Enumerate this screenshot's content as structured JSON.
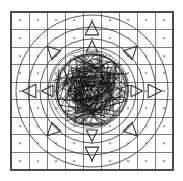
{
  "figure": {
    "background_color": "#ffffff",
    "width": 183,
    "height": 181
  },
  "grid": {
    "name": "cell-grid",
    "columns": 9,
    "rows": 9,
    "left": 11,
    "top": 12,
    "right": 173,
    "bottom": 170,
    "cell_mark": "×",
    "line_color": "#6f6f6f",
    "frame_color": "#4a4a4a",
    "mark_color": "#4f4f4f",
    "marks": [
      [
        "×",
        "×",
        "×",
        "×",
        "×",
        "×",
        "×",
        "×",
        "×"
      ],
      [
        "×",
        "×",
        "×",
        "×",
        "×",
        "×",
        "×",
        "×",
        "×"
      ],
      [
        "×",
        "×",
        "×",
        "×",
        "×",
        "×",
        "×",
        "×",
        "×"
      ],
      [
        "×",
        "×",
        "×",
        "×",
        "×",
        "×",
        "×",
        "×",
        "×"
      ],
      [
        "×",
        "×",
        "×",
        "×",
        "×",
        "×",
        "×",
        "×",
        "×"
      ],
      [
        "×",
        "×",
        "×",
        "×",
        "×",
        "×",
        "×",
        "×",
        "×"
      ],
      [
        "×",
        "×",
        "×",
        "×",
        "×",
        "×",
        "×",
        "×",
        "×"
      ],
      [
        "×",
        "×",
        "×",
        "×",
        "×",
        "×",
        "×",
        "×",
        "×"
      ],
      [
        "×",
        "×",
        "×",
        "×",
        "×",
        "×",
        "×",
        "×",
        "×"
      ]
    ]
  },
  "rings": {
    "name": "concentric-circles",
    "center_x": 92,
    "center_y": 91,
    "color": "#3a3a3a",
    "radii": [
      76,
      64,
      52,
      44
    ]
  },
  "arrows": {
    "name": "radial-triangle-arrows",
    "color": "#2e2e2e",
    "count": 12,
    "items": [
      {
        "label": "arrow-up",
        "angle": -90,
        "distance": 62,
        "size": 13
      },
      {
        "label": "arrow-up-inner",
        "angle": -90,
        "distance": 44,
        "size": 11
      },
      {
        "label": "arrow-down",
        "angle": 90,
        "distance": 62,
        "size": 13
      },
      {
        "label": "arrow-down-inner",
        "angle": 90,
        "distance": 44,
        "size": 11
      },
      {
        "label": "arrow-left",
        "angle": 180,
        "distance": 62,
        "size": 13
      },
      {
        "label": "arrow-left-inner",
        "angle": 180,
        "distance": 44,
        "size": 11
      },
      {
        "label": "arrow-right",
        "angle": 0,
        "distance": 62,
        "size": 13
      },
      {
        "label": "arrow-right-inner",
        "angle": 0,
        "distance": 44,
        "size": 11
      },
      {
        "label": "arrow-up-left",
        "angle": -135,
        "distance": 56,
        "size": 12
      },
      {
        "label": "arrow-up-right",
        "angle": -45,
        "distance": 56,
        "size": 12
      },
      {
        "label": "arrow-down-left",
        "angle": 135,
        "distance": 56,
        "size": 12
      },
      {
        "label": "arrow-down-right",
        "angle": 45,
        "distance": 56,
        "size": 12
      }
    ]
  },
  "scribble": {
    "name": "chord-mesh-disc",
    "center_x": 91,
    "center_y": 90,
    "radius": 40,
    "chord_count": 150,
    "color": "#111111",
    "seed": 20240117
  }
}
